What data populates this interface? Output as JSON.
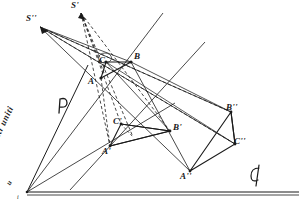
{
  "figure": {
    "background_color": "#ffffff",
    "ink_color": "#1a1a1a",
    "annotations": {
      "axis_line_label": "u retta di punti uniti",
      "center_label_s_prime": "S'",
      "center_label_s_double": "S''",
      "plane_label": "P",
      "direction_label": "d",
      "vertex_label": "u",
      "base_label": "i"
    },
    "triangles": [
      {
        "name": "triangle-abc",
        "vertices": [
          {
            "label": "A",
            "x": 101,
            "y": 78
          },
          {
            "label": "B",
            "x": 131,
            "y": 62
          },
          {
            "label": "C",
            "x": 106,
            "y": 62
          }
        ],
        "label_offsets": [
          {
            "label": "A",
            "x": 89,
            "y": 79
          },
          {
            "label": "B",
            "x": 134,
            "y": 54
          },
          {
            "label": "C",
            "x": 99,
            "y": 59
          }
        ]
      },
      {
        "name": "triangle-a-prime",
        "vertices": [
          {
            "label": "A'",
            "x": 110,
            "y": 146
          },
          {
            "label": "B'",
            "x": 170,
            "y": 131
          },
          {
            "label": "C'",
            "x": 121,
            "y": 124
          }
        ],
        "label_offsets": [
          {
            "label": "A'",
            "x": 104,
            "y": 149
          },
          {
            "label": "B'",
            "x": 173,
            "y": 125
          },
          {
            "label": "C'",
            "x": 114,
            "y": 120
          }
        ]
      },
      {
        "name": "triangle-a-double-prime",
        "vertices": [
          {
            "label": "A''",
            "x": 190,
            "y": 171
          },
          {
            "label": "B''",
            "x": 231,
            "y": 112
          },
          {
            "label": "C''",
            "x": 235,
            "y": 144
          }
        ],
        "label_offsets": [
          {
            "label": "A''",
            "x": 182,
            "y": 174
          },
          {
            "label": "B''",
            "x": 227,
            "y": 105
          },
          {
            "label": "C''",
            "x": 234,
            "y": 139
          }
        ]
      }
    ],
    "centers": [
      {
        "label": "S'",
        "x": 81,
        "y": 13,
        "label_x": 73,
        "label_y": 3
      },
      {
        "label": "S''",
        "x": 40,
        "y": 27,
        "label_x": 28,
        "label_y": 16
      }
    ],
    "base_point": {
      "label": "i",
      "x": 27,
      "y": 192,
      "label_x": 19,
      "label_y": 194
    },
    "axis_vertex_label": {
      "label": "u",
      "x": 8,
      "y": 182
    },
    "plane_marker": {
      "label": "P",
      "x": 58,
      "y": 100
    },
    "direction_marker": {
      "label": "d",
      "x": 254,
      "y": 168
    }
  }
}
